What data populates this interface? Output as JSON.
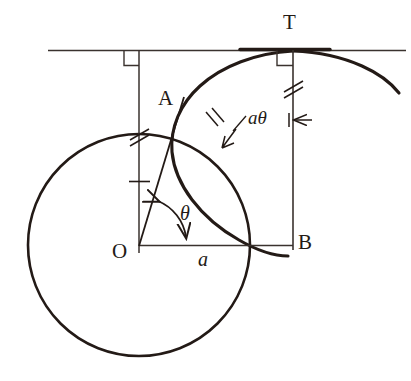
{
  "figure": {
    "kind": "geometry-diagram",
    "background_color": "#ffffff",
    "ink_color": "#231a16",
    "thin_line_color": "#3a322e"
  },
  "labels": {
    "point_o": "O",
    "point_a": "A",
    "point_b": "B",
    "point_t": "T",
    "radius": "a",
    "angle": "θ",
    "arc_length": "aθ"
  },
  "geometry": {
    "circle": {
      "cx": 139,
      "cy": 245,
      "r": 111
    },
    "tangent_line": {
      "x1": 48,
      "y1": 50,
      "x2": 406,
      "y2": 50
    },
    "point_o": {
      "x": 139,
      "y": 245
    },
    "point_a": {
      "x": 180,
      "y": 108
    },
    "point_b": {
      "x": 293,
      "y": 245
    },
    "point_t": {
      "x": 293,
      "y": 50
    },
    "vertical_left": {
      "x": 139,
      "y1": 50,
      "y2": 253
    },
    "vertical_tb": {
      "x": 293,
      "y1": 50,
      "y2": 250
    },
    "segment_ob": {
      "x1": 139,
      "y1": 245,
      "x2": 293,
      "y2": 245
    },
    "ray_oa": {
      "x1": 139,
      "y1": 245,
      "x2": 183,
      "y2": 100
    },
    "angle_arc_radius": 46,
    "tick_marks": {
      "left_vertical_double": {
        "x": 139,
        "y": 135
      },
      "left_vertical_single": {
        "x": 139,
        "y": 181
      },
      "tb_vertical_double": {
        "x": 293,
        "y": 88
      },
      "arc_double": {
        "x": 212,
        "y": 120
      }
    },
    "right_angle_marks": [
      {
        "x": 139,
        "y": 50,
        "side": "left"
      },
      {
        "x": 293,
        "y": 50,
        "side": "left"
      }
    ]
  },
  "label_positions": {
    "point_o": {
      "x": 112,
      "y": 241
    },
    "point_a": {
      "x": 158,
      "y": 88
    },
    "point_b": {
      "x": 298,
      "y": 232
    },
    "point_t": {
      "x": 283,
      "y": 12
    },
    "radius": {
      "x": 198,
      "y": 249
    },
    "angle": {
      "x": 180,
      "y": 203
    },
    "arc_length": {
      "x": 248,
      "y": 108
    }
  }
}
